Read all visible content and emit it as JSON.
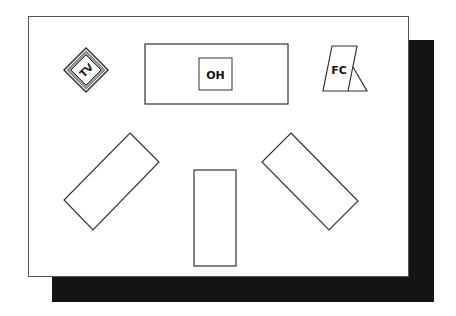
{
  "diagram": {
    "title": "",
    "colors": {
      "background": "#ffffff",
      "outline": "#333333",
      "shadow": "#141414",
      "tv_frame": "#888888"
    },
    "items": [
      {
        "id": "tv",
        "label": "TV",
        "kind": "television",
        "shape": "diamond"
      },
      {
        "id": "overhead",
        "label": "OH",
        "kind": "overhead-projector",
        "shape": "rectangle-in-rectangle"
      },
      {
        "id": "flipchart",
        "label": "FC",
        "kind": "flip-chart",
        "shape": "easel"
      },
      {
        "id": "table-left",
        "label": "",
        "kind": "table",
        "shape": "rotated-rectangle"
      },
      {
        "id": "table-center",
        "label": "",
        "kind": "table",
        "shape": "rectangle"
      },
      {
        "id": "table-right",
        "label": "",
        "kind": "table",
        "shape": "rotated-rectangle"
      }
    ]
  }
}
